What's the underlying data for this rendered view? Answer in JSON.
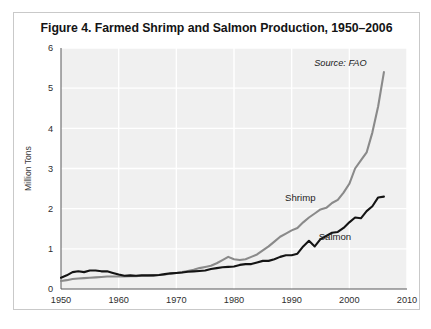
{
  "figure": {
    "title": "Figure 4. Farmed Shrimp and Salmon Production, 1950–2006",
    "source_note": "Source: FAO"
  },
  "chart_data": {
    "type": "line",
    "title": "Figure 4. Farmed Shrimp and Salmon Production, 1950–2006",
    "xlabel": "",
    "ylabel": "Million Tons",
    "xlim": [
      1950,
      2010
    ],
    "ylim": [
      0,
      6
    ],
    "xticks": [
      1950,
      1960,
      1970,
      1980,
      1990,
      2000,
      2010
    ],
    "xtick_labels": [
      "1950",
      "1960",
      "1970",
      "1980",
      "1990",
      "2000",
      "2010"
    ],
    "yticks": [
      0,
      1,
      2,
      3,
      4,
      5,
      6
    ],
    "ytick_labels": [
      "0",
      "1",
      "2",
      "3",
      "4",
      "5",
      "6"
    ],
    "grid": true,
    "grid_color": "#ffffff",
    "plot_background": "#f0f0f0",
    "legend": "inline-labels",
    "annotations": [
      {
        "text": "Source: FAO",
        "x": 2003,
        "y": 5.55
      },
      {
        "text": "Shrimp",
        "x": 1991.5,
        "y": 2.2
      },
      {
        "text": "Salmon",
        "x": 1997.5,
        "y": 1.22
      }
    ],
    "x": [
      1950,
      1951,
      1952,
      1953,
      1954,
      1955,
      1956,
      1957,
      1958,
      1959,
      1960,
      1961,
      1962,
      1963,
      1964,
      1965,
      1966,
      1967,
      1968,
      1969,
      1970,
      1971,
      1972,
      1973,
      1974,
      1975,
      1976,
      1977,
      1978,
      1979,
      1980,
      1981,
      1982,
      1983,
      1984,
      1985,
      1986,
      1987,
      1988,
      1989,
      1990,
      1991,
      1992,
      1993,
      1994,
      1995,
      1996,
      1997,
      1998,
      1999,
      2000,
      2001,
      2002,
      2003,
      2004,
      2005,
      2006
    ],
    "series": [
      {
        "name": "Shrimp",
        "color": "#8a8a8a",
        "values": [
          0.2,
          0.22,
          0.25,
          0.26,
          0.27,
          0.28,
          0.29,
          0.3,
          0.31,
          0.31,
          0.31,
          0.31,
          0.32,
          0.32,
          0.33,
          0.33,
          0.34,
          0.35,
          0.36,
          0.38,
          0.4,
          0.42,
          0.45,
          0.48,
          0.52,
          0.55,
          0.58,
          0.64,
          0.72,
          0.8,
          0.74,
          0.72,
          0.74,
          0.8,
          0.86,
          0.96,
          1.06,
          1.18,
          1.3,
          1.38,
          1.46,
          1.52,
          1.66,
          1.78,
          1.88,
          1.98,
          2.02,
          2.14,
          2.22,
          2.4,
          2.62,
          3.0,
          3.2,
          3.4,
          3.9,
          4.55,
          5.4
        ]
      },
      {
        "name": "Salmon",
        "color": "#141414",
        "values": [
          0.28,
          0.34,
          0.42,
          0.44,
          0.42,
          0.46,
          0.46,
          0.44,
          0.44,
          0.4,
          0.36,
          0.33,
          0.34,
          0.33,
          0.34,
          0.34,
          0.34,
          0.35,
          0.37,
          0.39,
          0.4,
          0.41,
          0.43,
          0.44,
          0.45,
          0.46,
          0.5,
          0.52,
          0.54,
          0.55,
          0.56,
          0.6,
          0.62,
          0.62,
          0.66,
          0.7,
          0.7,
          0.74,
          0.8,
          0.84,
          0.84,
          0.88,
          1.06,
          1.2,
          1.06,
          1.24,
          1.32,
          1.4,
          1.42,
          1.52,
          1.66,
          1.78,
          1.76,
          1.94,
          2.06,
          2.28,
          2.3
        ]
      }
    ]
  }
}
